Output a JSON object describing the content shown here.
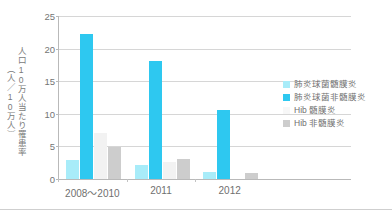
{
  "chart_data": {
    "type": "bar",
    "title": "",
    "subtitle": "",
    "xlabel": "",
    "ylabel": "人口10万人当たり罹患率（人／10万人）",
    "ylabel_lines": [
      "人口10万人当たり罹患率",
      "（人／10万人）"
    ],
    "categories": [
      "2008〜2010",
      "2011",
      "2012"
    ],
    "ylim": [
      0,
      25
    ],
    "yticks": [
      0,
      5,
      10,
      15,
      20,
      25
    ],
    "ytick_labels": [
      "0",
      "5",
      "10",
      "15",
      "20",
      "25"
    ],
    "grid": true,
    "grid_axis": "y",
    "legend_position": "right",
    "series": [
      {
        "name": "肺炎球菌髄膜炎",
        "color": "#a8ecf9",
        "values": [
          2.9,
          2.1,
          1.1
        ]
      },
      {
        "name": "肺炎球菌非髄膜炎",
        "color": "#2ec8f0",
        "values": [
          22.2,
          18.1,
          10.6
        ]
      },
      {
        "name": "Hib 髄膜炎",
        "color": "#f2f2f2",
        "values": [
          7.0,
          2.6,
          0.0
        ]
      },
      {
        "name": "Hib 非髄膜炎",
        "color": "#cdcdcd",
        "values": [
          4.9,
          3.0,
          0.9
        ]
      }
    ]
  },
  "legend": {
    "items": [
      {
        "label": "肺炎球菌髄膜炎",
        "color": "#a8ecf9"
      },
      {
        "label": "肺炎球菌非髄膜炎",
        "color": "#2ec8f0"
      },
      {
        "label": "Hib 髄膜炎",
        "color": "#f7f7f7"
      },
      {
        "label": "Hib 非髄膜炎",
        "color": "#cdcdcd"
      }
    ]
  }
}
